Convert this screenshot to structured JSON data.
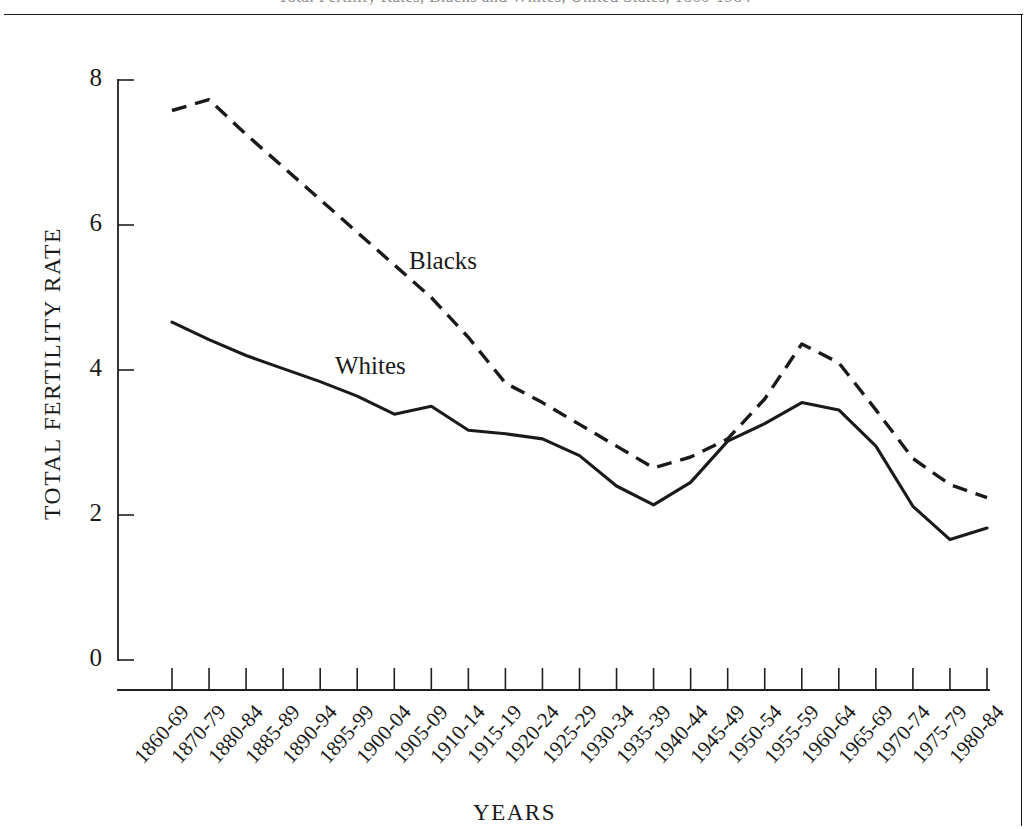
{
  "page": {
    "top_caption": "Total Fertility Rates, Blacks and Whites, United States, 1860-1984"
  },
  "chart_data": {
    "type": "line",
    "title": "",
    "xlabel": "YEARS",
    "ylabel": "TOTAL FERTILITY RATE",
    "ylim": [
      0,
      8
    ],
    "yticks": [
      0,
      2,
      4,
      6,
      8
    ],
    "ytick_labels": [
      "0",
      "2",
      "4",
      "6",
      "8"
    ],
    "grid": false,
    "legend_position": "inline-annotation",
    "categories": [
      "1860-69",
      "1870-79",
      "1880-84",
      "1885-89",
      "1890-94",
      "1895-99",
      "1900-04",
      "1905-09",
      "1910-14",
      "1915-19",
      "1920-24",
      "1925-29",
      "1930-34",
      "1935-39",
      "1940-44",
      "1945-49",
      "1950-54",
      "1955-59",
      "1960-64",
      "1965-69",
      "1970-74",
      "1975-79",
      "1980-84"
    ],
    "series": [
      {
        "name": "Blacks",
        "style": "dashed",
        "color": "#1a1a1a",
        "start_index": 0,
        "values": [
          7.58,
          7.73,
          7.25,
          6.8,
          6.35,
          5.9,
          5.45,
          5.0,
          4.45,
          3.82,
          3.55,
          3.25,
          2.95,
          2.65,
          2.8,
          3.05,
          3.6,
          4.36,
          4.1,
          3.45,
          2.78,
          2.42,
          2.24
        ]
      },
      {
        "name": "Whites",
        "style": "solid",
        "color": "#1a1a1a",
        "start_index": 0,
        "values": [
          4.66,
          4.42,
          4.2,
          4.02,
          3.84,
          3.64,
          3.39,
          3.5,
          3.17,
          3.12,
          3.05,
          2.82,
          2.4,
          2.14,
          2.45,
          3.02,
          3.26,
          3.55,
          3.45,
          2.95,
          2.12,
          1.66,
          1.82
        ]
      }
    ],
    "annotations": [
      {
        "text": "Blacks",
        "series": "Blacks"
      },
      {
        "text": "Whites",
        "series": "Whites"
      }
    ]
  }
}
